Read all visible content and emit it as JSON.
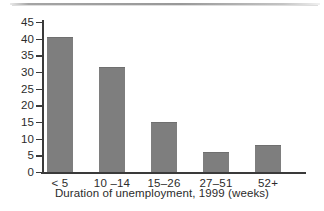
{
  "figure": {
    "background_color": "#ffffff",
    "axis_color": "#3a3a3a",
    "bar_color": "#7e7e7e",
    "text_color": "#2b2b2b"
  },
  "chart_data": {
    "type": "bar",
    "title": "",
    "xlabel": "Duration of unemployment, 1999 (weeks)",
    "ylabel": "",
    "categories": [
      "< 5",
      "10 –14",
      "15–26",
      "27–51",
      "52+"
    ],
    "values": [
      40.5,
      31.5,
      15,
      6,
      8
    ],
    "ylim": [
      0,
      45
    ],
    "yticks": [
      0,
      5,
      10,
      15,
      20,
      25,
      30,
      35,
      40,
      45
    ],
    "ytick_labels": [
      "0",
      "5",
      "10",
      "15",
      "20",
      "25",
      "30",
      "35",
      "40",
      "45"
    ],
    "grid": false,
    "legend": null
  }
}
